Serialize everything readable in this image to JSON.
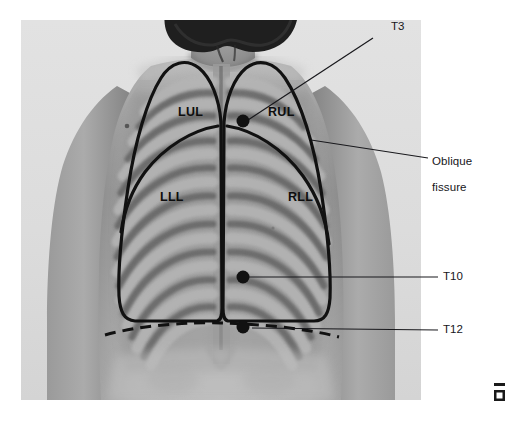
{
  "figure": {
    "kind": "anatomy-photograph-with-overlay",
    "width": 507,
    "height": 430,
    "background_color": "#ffffff",
    "photo_background_color": "#dcdcdc"
  },
  "annotations": {
    "t3": {
      "label": "T3",
      "x": 391,
      "y": 26,
      "leader": {
        "x1": 373,
        "y1": 38,
        "x2": 248,
        "y2": 120
      },
      "marker": {
        "x": 243,
        "y": 121,
        "r": 6.5,
        "color": "#111111"
      }
    },
    "oblique_fissure": {
      "label": "Oblique\nfissure",
      "line1": "Oblique",
      "line2": "fissure",
      "x": 432,
      "y": 148,
      "leader": {
        "x1": 428,
        "y1": 158,
        "x2": 311,
        "y2": 140
      }
    },
    "t10": {
      "label": "T10",
      "x": 443,
      "y": 271,
      "leader": {
        "x1": 438,
        "y1": 277,
        "x2": 248,
        "y2": 277
      },
      "marker": {
        "x": 243,
        "y": 277,
        "r": 6.5,
        "color": "#111111"
      }
    },
    "t12": {
      "label": "T12",
      "x": 443,
      "y": 324,
      "leader": {
        "x1": 438,
        "y1": 330,
        "x2": 250,
        "y2": 327
      },
      "marker": {
        "x": 243,
        "y": 327,
        "r": 6.5,
        "color": "#111111"
      }
    }
  },
  "lobes": [
    {
      "key": "lul",
      "label": "LUL",
      "name": "left upper lobe",
      "x": 178,
      "y": 105
    },
    {
      "key": "rul",
      "label": "RUL",
      "name": "right upper lobe",
      "x": 268,
      "y": 105
    },
    {
      "key": "lll",
      "label": "LLL",
      "name": "left lower lobe",
      "x": 160,
      "y": 190
    },
    {
      "key": "rll",
      "label": "RLL",
      "name": "right lower lobe",
      "x": 288,
      "y": 190
    }
  ],
  "colors": {
    "outline": "#111111",
    "marker": "#111111",
    "leader_line": "#18181c",
    "label_text": "#16161a",
    "lobe_text": "#0d0d0d",
    "skin_light": "#b9b9b9",
    "skin_mid": "#999999",
    "skin_shadow": "#6f6f6f",
    "rib_light": "#a8a8a8",
    "intercostal_dark": "#5e5e5e",
    "hair": "#1c1c1c",
    "photo_bg": "#dcdcdc"
  },
  "overlay": {
    "outline_stroke_width": 3.2,
    "dashed_line_dasharray": "11 7",
    "description": "Black outlines trace the lung fields over the posterior chest; a solid oblique fissure line separates upper and lower lobes on each side; a dashed line at T12 marks the lower lung border."
  }
}
